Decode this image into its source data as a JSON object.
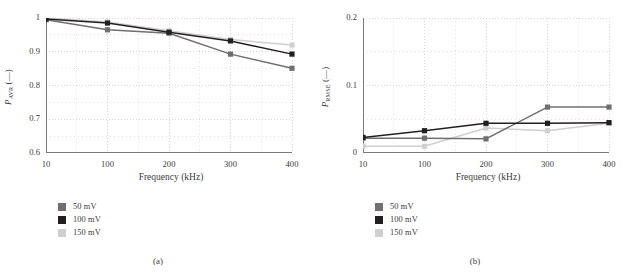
{
  "figure": {
    "panels": [
      {
        "id": "a",
        "caption": "(a)",
        "legend": [
          {
            "label": "50 mV",
            "color": "#6f6f6f"
          },
          {
            "label": "100 mV",
            "color": "#231f20"
          },
          {
            "label": "150 mV",
            "color": "#cfcfcf"
          }
        ]
      },
      {
        "id": "b",
        "caption": "(b)",
        "legend": [
          {
            "label": "50 mV",
            "color": "#6f6f6f"
          },
          {
            "label": "100 mV",
            "color": "#231f20"
          },
          {
            "label": "150 mV",
            "color": "#cfcfcf"
          }
        ]
      }
    ]
  },
  "chart_data": [
    {
      "type": "line",
      "panel": "a",
      "title": "",
      "xlabel": "Frequency (kHz)",
      "ylabel": "P_AVR (—)",
      "ylabel_base": "P",
      "ylabel_sub": "AVR",
      "ylabel_unit": "(—)",
      "categories": [
        "10",
        "100",
        "200",
        "300",
        "400"
      ],
      "x_tick_labels": [
        "10",
        "100",
        "200",
        "300",
        "400"
      ],
      "y_tick_labels": [
        "0.6",
        "0.7",
        "0.8",
        "0.9",
        "1"
      ],
      "y_tick_values": [
        0.6,
        0.7,
        0.8,
        0.9,
        1.0
      ],
      "ylim": [
        0.6,
        1.0
      ],
      "grid": true,
      "grid_style": "dotted",
      "legend_position": "below-left",
      "marker": "square",
      "series": [
        {
          "name": "50 mV",
          "color": "#6f6f6f",
          "values": [
            0.995,
            0.965,
            0.955,
            0.893,
            0.851
          ]
        },
        {
          "name": "100 mV",
          "color": "#231f20",
          "values": [
            0.997,
            0.985,
            0.958,
            0.932,
            0.893
          ]
        },
        {
          "name": "150 mV",
          "color": "#cfcfcf",
          "values": [
            1.0,
            0.988,
            0.962,
            0.936,
            0.92
          ]
        }
      ]
    },
    {
      "type": "line",
      "panel": "b",
      "title": "",
      "xlabel": "Frequency (kHz)",
      "ylabel": "P_RMSE (—)",
      "ylabel_base": "P",
      "ylabel_sub": "RMSE",
      "ylabel_unit": "(—)",
      "categories": [
        "10",
        "100",
        "200",
        "300",
        "400"
      ],
      "x_tick_labels": [
        "10",
        "100",
        "200",
        "300",
        "400"
      ],
      "y_tick_labels": [
        "0",
        "0.1",
        "0.2"
      ],
      "y_tick_values": [
        0.0,
        0.1,
        0.2
      ],
      "ylim": [
        0.0,
        0.2
      ],
      "grid": true,
      "grid_style": "dotted",
      "legend_position": "below-left",
      "marker": "square",
      "series": [
        {
          "name": "50 mV",
          "color": "#6f6f6f",
          "values": [
            0.022,
            0.022,
            0.021,
            0.068,
            0.068
          ]
        },
        {
          "name": "100 mV",
          "color": "#231f20",
          "values": [
            0.023,
            0.033,
            0.044,
            0.044,
            0.045
          ]
        },
        {
          "name": "150 mV",
          "color": "#cfcfcf",
          "values": [
            0.01,
            0.01,
            0.037,
            0.033,
            0.044
          ]
        }
      ]
    }
  ]
}
